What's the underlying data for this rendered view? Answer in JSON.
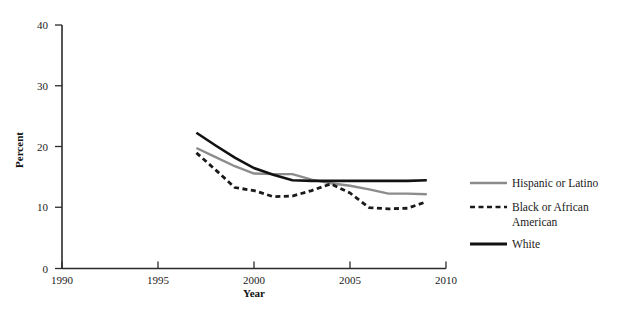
{
  "chart_data": {
    "type": "line",
    "title": "",
    "xlabel": "Year",
    "ylabel": "Percent",
    "xlim": [
      1990,
      2010
    ],
    "ylim": [
      0,
      40
    ],
    "xticks": [
      1990,
      1995,
      2000,
      2005,
      2010
    ],
    "yticks": [
      0,
      10,
      20,
      30,
      40
    ],
    "grid": false,
    "legend_position": "right",
    "x": [
      1997,
      1998,
      1999,
      2000,
      2001,
      2002,
      2003,
      2004,
      2005,
      2006,
      2007,
      2008,
      2009
    ],
    "series": [
      {
        "name": "Hispanic or Latino",
        "color": "#8c8c8c",
        "style": "solid",
        "values": [
          19.8,
          18.3,
          16.8,
          15.6,
          15.5,
          15.5,
          14.6,
          14.0,
          13.6,
          13.0,
          12.3,
          12.3,
          12.2
        ]
      },
      {
        "name": "Black or African American",
        "color": "#1a1a1a",
        "style": "dashed",
        "values": [
          19.0,
          16.2,
          13.3,
          12.8,
          11.8,
          11.9,
          12.8,
          13.9,
          12.4,
          10.0,
          9.8,
          9.9,
          11.0
        ]
      },
      {
        "name": "White",
        "color": "#121212",
        "style": "solid",
        "values": [
          22.3,
          20.2,
          18.2,
          16.5,
          15.4,
          14.5,
          14.4,
          14.4,
          14.4,
          14.4,
          14.4,
          14.4,
          14.5
        ]
      }
    ]
  },
  "axes": {
    "y_label": "Percent",
    "x_label": "Year",
    "y_tick_labels": [
      "0",
      "10",
      "20",
      "30",
      "40"
    ],
    "x_tick_labels": [
      "1990",
      "1995",
      "2000",
      "2005",
      "2010"
    ]
  },
  "legend": {
    "items": [
      {
        "label": "Hispanic or Latino",
        "label_line2": "",
        "swatch": "solid-gray-line-icon"
      },
      {
        "label": "Black or African",
        "label_line2": "American",
        "swatch": "dashed-black-line-icon"
      },
      {
        "label": "White",
        "label_line2": "",
        "swatch": "solid-black-line-icon"
      }
    ]
  }
}
